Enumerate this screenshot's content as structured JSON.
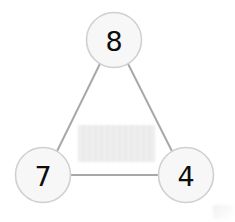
{
  "figure": {
    "kind": "node-link-graph",
    "background_color": "#ffffff",
    "width": 235,
    "height": 222
  },
  "style": {
    "node_fill": "#f7f7f7",
    "node_stroke": "#d0d0d0",
    "node_stroke_width": 1.6,
    "node_radius": 27.5,
    "edge_color": "#a8a8a8",
    "edge_width": 2,
    "label_color": "#0d0d0d",
    "redaction_color": "#e9e9e9"
  },
  "nodes": [
    {
      "id": "top",
      "label": "8",
      "cx": 114,
      "cy": 40
    },
    {
      "id": "bottom-left",
      "label": "7",
      "cx": 43,
      "cy": 175
    },
    {
      "id": "bottom-right",
      "label": "4",
      "cx": 186,
      "cy": 175
    }
  ],
  "edges": [
    {
      "id": "edge-top-bottomleft",
      "from": "top",
      "to": "bottom-left",
      "x1": 100.0,
      "y1": 63.7,
      "x2": 57.0,
      "y2": 151.3
    },
    {
      "id": "edge-top-bottomright",
      "from": "top",
      "to": "bottom-right",
      "x1": 128.0,
      "y1": 63.7,
      "x2": 172.0,
      "y2": 151.3
    },
    {
      "id": "edge-bottomleft-bottomright",
      "from": "bottom-left",
      "to": "bottom-right",
      "x1": 70.5,
      "y1": 175,
      "x2": 158.5,
      "y2": 175
    }
  ],
  "redacted_label": {
    "description": "blurred grey rectangle",
    "x": 78,
    "y": 125,
    "width": 77,
    "height": 37,
    "text": ""
  }
}
